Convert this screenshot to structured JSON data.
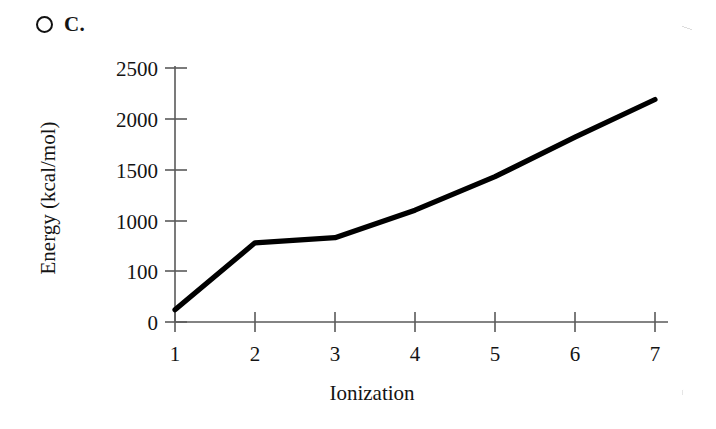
{
  "choice": {
    "marker_icon": "radio-unselected-icon",
    "letter": "C."
  },
  "chart_data": {
    "type": "line",
    "title": "",
    "xlabel": "Ionization",
    "ylabel": "Energy (kcal/mol)",
    "x": [
      1,
      2,
      3,
      4,
      5,
      6,
      7
    ],
    "values": [
      120,
      780,
      830,
      1100,
      1430,
      1820,
      2190
    ],
    "series": [
      {
        "name": "Ionization energy",
        "values": [
          120,
          780,
          830,
          1100,
          1430,
          1820,
          2190
        ]
      }
    ],
    "xtick_labels": [
      "1",
      "2",
      "3",
      "4",
      "5",
      "6",
      "7"
    ],
    "ytick_labels": [
      "0",
      "100",
      "1000",
      "1500",
      "2000",
      "2500"
    ],
    "ytick_positions": [
      0,
      500,
      1000,
      1500,
      2000,
      2500
    ],
    "xlim": [
      1,
      7
    ],
    "ylim": [
      0,
      2500
    ],
    "grid": false,
    "legend": false,
    "line_color": "#000000"
  }
}
